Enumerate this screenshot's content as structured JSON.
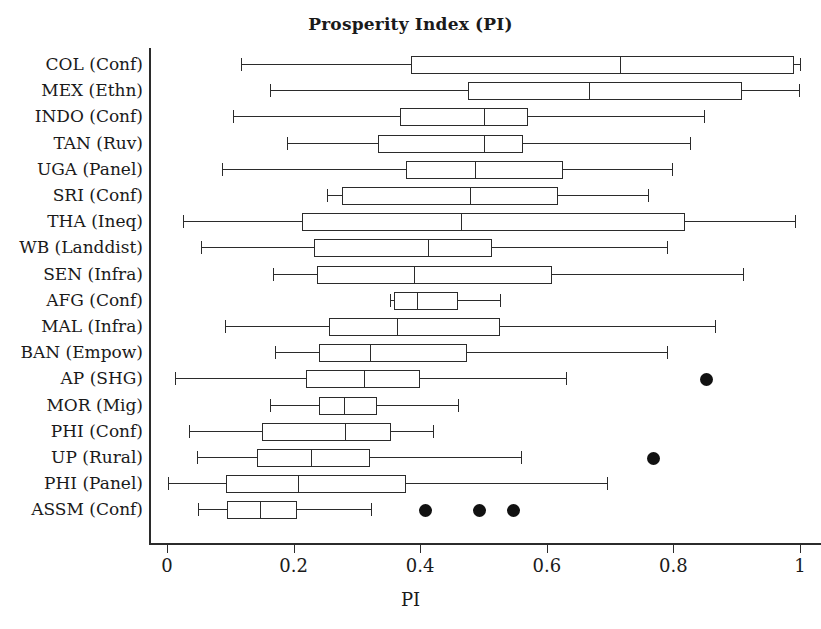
{
  "chart_data": {
    "type": "box",
    "title": "Prosperity Index (PI)",
    "xlabel": "PI",
    "ylabel": "",
    "xlim": [
      0,
      1
    ],
    "xticks": [
      0,
      0.2,
      0.4,
      0.6,
      0.8,
      1
    ],
    "xtick_labels": [
      "0",
      "0.2",
      "0.4",
      "0.6",
      "0.8",
      "1"
    ],
    "grid": false,
    "legend": null,
    "orientation": "horizontal",
    "categories": [
      "COL (Conf)",
      "MEX (Ethn)",
      "INDO (Conf)",
      "TAN (Ruv)",
      "UGA (Panel)",
      "SRI (Conf)",
      "THA (Ineq)",
      "WB (Landdist)",
      "SEN (Infra)",
      "AFG (Conf)",
      "MAL (Infra)",
      "BAN (Empow)",
      "AP (SHG)",
      "MOR (Mig)",
      "PHI (Conf)",
      "UP (Rural)",
      "PHI (Panel)",
      "ASSM (Conf)"
    ],
    "boxes": [
      {
        "label": "COL (Conf)",
        "whisker_low": 0.117,
        "q1": 0.385,
        "median": 0.716,
        "q3": 0.99,
        "whisker_high": 1.0,
        "outliers": []
      },
      {
        "label": "MEX (Ethn)",
        "whisker_low": 0.163,
        "q1": 0.476,
        "median": 0.666,
        "q3": 0.908,
        "whisker_high": 0.998,
        "outliers": []
      },
      {
        "label": "INDO (Conf)",
        "whisker_low": 0.105,
        "q1": 0.368,
        "median": 0.5,
        "q3": 0.571,
        "whisker_high": 0.848,
        "outliers": []
      },
      {
        "label": "TAN (Ruv)",
        "whisker_low": 0.19,
        "q1": 0.334,
        "median": 0.5,
        "q3": 0.563,
        "whisker_high": 0.826,
        "outliers": []
      },
      {
        "label": "UGA (Panel)",
        "whisker_low": 0.087,
        "q1": 0.378,
        "median": 0.487,
        "q3": 0.626,
        "whisker_high": 0.798,
        "outliers": []
      },
      {
        "label": "SRI (Conf)",
        "whisker_low": 0.252,
        "q1": 0.277,
        "median": 0.479,
        "q3": 0.618,
        "whisker_high": 0.76,
        "outliers": []
      },
      {
        "label": "THA (Ineq)",
        "whisker_low": 0.025,
        "q1": 0.213,
        "median": 0.465,
        "q3": 0.819,
        "whisker_high": 0.992,
        "outliers": []
      },
      {
        "label": "WB (Landdist)",
        "whisker_low": 0.053,
        "q1": 0.232,
        "median": 0.413,
        "q3": 0.513,
        "whisker_high": 0.79,
        "outliers": []
      },
      {
        "label": "SEN (Infra)",
        "whisker_low": 0.168,
        "q1": 0.237,
        "median": 0.39,
        "q3": 0.608,
        "whisker_high": 0.91,
        "outliers": []
      },
      {
        "label": "AFG (Conf)",
        "whisker_low": 0.352,
        "q1": 0.358,
        "median": 0.395,
        "q3": 0.46,
        "whisker_high": 0.526,
        "outliers": []
      },
      {
        "label": "MAL (Infra)",
        "whisker_low": 0.092,
        "q1": 0.256,
        "median": 0.364,
        "q3": 0.526,
        "whisker_high": 0.866,
        "outliers": []
      },
      {
        "label": "BAN (Empow)",
        "whisker_low": 0.17,
        "q1": 0.24,
        "median": 0.321,
        "q3": 0.474,
        "whisker_high": 0.79,
        "outliers": []
      },
      {
        "label": "AP (SHG)",
        "whisker_low": 0.013,
        "q1": 0.22,
        "median": 0.311,
        "q3": 0.4,
        "whisker_high": 0.63,
        "outliers": [
          0.852
        ]
      },
      {
        "label": "MOR (Mig)",
        "whisker_low": 0.163,
        "q1": 0.24,
        "median": 0.28,
        "q3": 0.332,
        "whisker_high": 0.46,
        "outliers": []
      },
      {
        "label": "PHI (Conf)",
        "whisker_low": 0.035,
        "q1": 0.15,
        "median": 0.281,
        "q3": 0.354,
        "whisker_high": 0.421,
        "outliers": []
      },
      {
        "label": "UP (Rural)",
        "whisker_low": 0.047,
        "q1": 0.142,
        "median": 0.228,
        "q3": 0.32,
        "whisker_high": 0.56,
        "outliers": [
          0.768
        ]
      },
      {
        "label": "PHI (Panel)",
        "whisker_low": 0.002,
        "q1": 0.093,
        "median": 0.207,
        "q3": 0.378,
        "whisker_high": 0.695,
        "outliers": []
      },
      {
        "label": "ASSM (Conf)",
        "whisker_low": 0.049,
        "q1": 0.095,
        "median": 0.147,
        "q3": 0.205,
        "whisker_high": 0.322,
        "outliers": [
          0.408,
          0.494,
          0.548
        ]
      }
    ]
  },
  "style": {
    "line_color": "#2b2b2b",
    "box_fill": "#ffffff",
    "outlier_color": "#111111",
    "background": "#ffffff"
  }
}
